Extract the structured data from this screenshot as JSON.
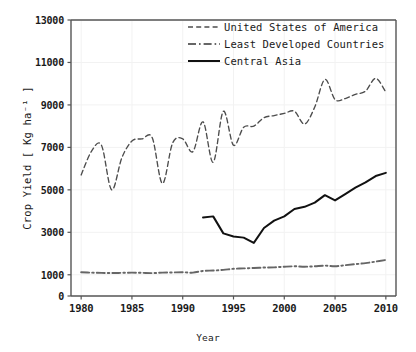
{
  "chart_data": {
    "type": "line",
    "title": "",
    "subtitle": "",
    "xlabel": "Year",
    "ylabel": "Crop Yield  [ Kg ha⁻¹ ]",
    "xlim": [
      1979,
      2011
    ],
    "ylim": [
      0,
      13000
    ],
    "xticks": [
      1980,
      1985,
      1990,
      1995,
      2000,
      2005,
      2010
    ],
    "yticks": [
      0,
      1000,
      3000,
      5000,
      7000,
      9000,
      11000,
      13000
    ],
    "grid": true,
    "grid_color": "#f2f2f2",
    "legend_position": "top-right",
    "series": [
      {
        "name": "United States of America",
        "style": "dashed",
        "color": "#4d4d4d",
        "x": [
          1980,
          1981,
          1982,
          1983,
          1984,
          1985,
          1986,
          1987,
          1988,
          1989,
          1990,
          1991,
          1992,
          1993,
          1994,
          1995,
          1996,
          1997,
          1998,
          1999,
          2000,
          2001,
          2002,
          2003,
          2004,
          2005,
          2006,
          2007,
          2008,
          2009,
          2010
        ],
        "values": [
          5700,
          6800,
          7100,
          5000,
          6500,
          7300,
          7400,
          7450,
          5300,
          7200,
          7400,
          6800,
          8200,
          6300,
          8700,
          7100,
          7950,
          8000,
          8400,
          8500,
          8600,
          8700,
          8100,
          8900,
          10200,
          9250,
          9300,
          9500,
          9650,
          10250,
          9600
        ]
      },
      {
        "name": "Least Developed Countries",
        "style": "dash-dot",
        "color": "#666666",
        "x": [
          1980,
          1981,
          1982,
          1983,
          1984,
          1985,
          1986,
          1987,
          1988,
          1989,
          1990,
          1991,
          1992,
          1993,
          1994,
          1995,
          1996,
          1997,
          1998,
          1999,
          2000,
          2001,
          2002,
          2003,
          2004,
          2005,
          2006,
          2007,
          2008,
          2009,
          2010
        ],
        "values": [
          1120,
          1100,
          1090,
          1080,
          1090,
          1100,
          1090,
          1080,
          1100,
          1110,
          1120,
          1100,
          1180,
          1200,
          1230,
          1280,
          1300,
          1320,
          1340,
          1350,
          1380,
          1400,
          1380,
          1400,
          1430,
          1400,
          1450,
          1500,
          1550,
          1620,
          1700
        ]
      },
      {
        "name": "Central Asia",
        "style": "solid",
        "color": "#111111",
        "x": [
          1992,
          1993,
          1994,
          1995,
          1996,
          1997,
          1998,
          1999,
          2000,
          2001,
          2002,
          2003,
          2004,
          2005,
          2006,
          2007,
          2008,
          2009,
          2010
        ],
        "values": [
          3700,
          3750,
          2950,
          2800,
          2750,
          2500,
          3200,
          3550,
          3750,
          4100,
          4200,
          4400,
          4750,
          4500,
          4800,
          5100,
          5350,
          5650,
          5800
        ]
      }
    ]
  },
  "axes": {
    "x_label": "Year",
    "y_label": "Crop Yield  [ Kg ha⁻¹ ]",
    "x_tick_labels": [
      "1980",
      "1985",
      "1990",
      "1995",
      "2000",
      "2005",
      "2010"
    ],
    "y_tick_labels": [
      "0",
      "1000",
      "3000",
      "5000",
      "7000",
      "9000",
      "11000",
      "13000"
    ]
  },
  "legend": {
    "items": [
      {
        "label": "United States of America",
        "style": "dashed"
      },
      {
        "label": "Least Developed Countries",
        "style": "dash-dot"
      },
      {
        "label": "Central Asia",
        "style": "solid"
      }
    ]
  }
}
